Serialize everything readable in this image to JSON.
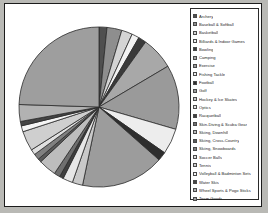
{
  "figure": {
    "background_color": "#ffffff",
    "border_color": "#1b1b1b",
    "outer_color": "#b9b9b5"
  },
  "legend": {
    "name": "Product Category",
    "border_color": "#2a2a2a",
    "position": "right"
  },
  "chart_data": {
    "type": "pie",
    "title": "",
    "subtitle": "",
    "xlabel": "",
    "ylabel": "",
    "grid": false,
    "legend_position": "right",
    "start_angle_deg": -90,
    "direction": "clockwise",
    "categories": [
      "Archery",
      "Baseball & Softball",
      "Basketball",
      "Billiards & Indoor Games",
      "Bowling",
      "Camping",
      "Exercise",
      "Fishing Tackle",
      "Football",
      "Golf",
      "Hockey & Ice Skates",
      "Optics",
      "Racquetball",
      "Skin-Diving & Scuba Gear",
      "Skiing, Downhill",
      "Skiing, Cross-Country",
      "Skiing, Snowboards",
      "Soccer Balls",
      "Tennis",
      "Volleyball & Badminton Sets",
      "Water Skis",
      "Wheel Sports & Pogo Sticks",
      "Team Goods"
    ],
    "values": [
      1.6,
      3.0,
      2.2,
      1.5,
      1.6,
      6.6,
      13.0,
      5.2,
      1.8,
      16.8,
      2.1,
      2.0,
      0.8,
      1.2,
      3.6,
      0.7,
      1.2,
      1.1,
      4.0,
      1.2,
      0.9,
      3.4,
      24.5
    ],
    "colors": [
      "#4f4f4f",
      "#8e8e8e",
      "#d4d4d4",
      "#f2f2f2",
      "#3a3a3a",
      "#a8a8a8",
      "#9a9a9a",
      "#ededed",
      "#2e2e2e",
      "#9c9c9c",
      "#c9c9c9",
      "#e6e6e6",
      "#3f3f3f",
      "#6f6f6f",
      "#bdbdbd",
      "#5a5a5a",
      "#808080",
      "#e0e0e0",
      "#cfcfcf",
      "#f5f5f5",
      "#454545",
      "#b2b2b2",
      "#9e9e9e"
    ],
    "wedge_edge_color": "#2b2b2b",
    "units": "percent"
  }
}
